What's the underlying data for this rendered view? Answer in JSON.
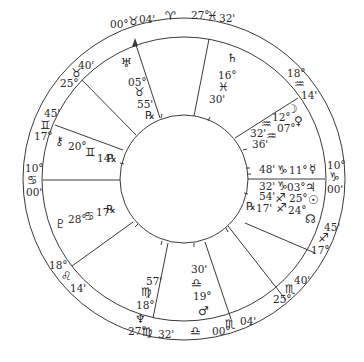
{
  "chart": {
    "type": "natal-wheel",
    "center": [
      184,
      179
    ],
    "radii": {
      "outer": 161,
      "middle": 142,
      "inner": 64
    },
    "line_color": "#3a3a3a"
  },
  "glyphs": {
    "aries": "♈",
    "taurus": "♉",
    "gemini": "♊",
    "cancer": "♋",
    "leo": "♌",
    "virgo": "♍",
    "libra": "♎",
    "scorpio": "♏",
    "sagittarius": "♐",
    "capricorn": "♑",
    "aquarius": "♒",
    "pisces": "♓",
    "sun": "☉",
    "moon": "☽",
    "mercury": "☿",
    "venus": "♀",
    "mars": "♂",
    "jupiter": "♃",
    "saturn": "♄",
    "uranus": "♅",
    "neptune": "♆",
    "pluto": "♇",
    "chiron": "⚷",
    "node": "☊",
    "retrograde": "℞"
  },
  "cusps": [
    {
      "id": "mc",
      "deg": "00°",
      "sign": "taurus",
      "min": "04'"
    },
    {
      "id": "c11",
      "deg": "27°",
      "sign": "pisces",
      "min": "32'"
    },
    {
      "id": "c12",
      "deg": "18°",
      "sign": "aquarius",
      "min": "14'"
    },
    {
      "id": "dsc",
      "deg": "10°",
      "sign": "capricorn",
      "min": "00'"
    },
    {
      "id": "c8",
      "deg": "17°",
      "sign": "sagittarius",
      "min": "45'"
    },
    {
      "id": "c7",
      "deg": "25°",
      "sign": "scorpio",
      "min": "40'"
    },
    {
      "id": "ic",
      "deg": "00°",
      "sign": "scorpio",
      "min": "04'"
    },
    {
      "id": "c5",
      "deg": "27°",
      "sign": "virgo",
      "min": "32'"
    },
    {
      "id": "c4",
      "deg": "18°",
      "sign": "leo",
      "min": "14'"
    },
    {
      "id": "asc",
      "deg": "10°",
      "sign": "cancer",
      "min": "00'"
    },
    {
      "id": "c2",
      "deg": "17°",
      "sign": "gemini",
      "min": "45'"
    },
    {
      "id": "c1",
      "deg": "25°",
      "sign": "taurus",
      "min": "40'"
    }
  ],
  "outer_ring_extra": {
    "aries_glyph": "♈",
    "libra_glyph": "♎"
  },
  "planets": [
    {
      "name": "Uranus",
      "glyph": "♅",
      "deg": "05°",
      "sign": "taurus",
      "min": "55'",
      "retro": true
    },
    {
      "name": "Saturn",
      "glyph": "♄",
      "deg": "16°",
      "sign": "pisces",
      "min": "30'",
      "retro": false
    },
    {
      "name": "Moon",
      "glyph": "☽",
      "deg": "12°",
      "sign": "aquarius",
      "min": "32'",
      "retro": false
    },
    {
      "name": "Venus",
      "glyph": "♀",
      "deg": "07°",
      "sign": "aquarius",
      "min": "36'",
      "retro": false
    },
    {
      "name": "Mercury",
      "glyph": "☿",
      "deg": "11°",
      "sign": "capricorn",
      "min": "48'",
      "retro": false
    },
    {
      "name": "Jupiter",
      "glyph": "♃",
      "deg": "03°",
      "sign": "capricorn",
      "min": "32'",
      "retro": false
    },
    {
      "name": "Sun",
      "glyph": "☉",
      "deg": "25°",
      "sign": "sagittarius",
      "min": "54'",
      "retro": false
    },
    {
      "name": "Node",
      "glyph": "☊",
      "deg": "24°",
      "sign": "sagittarius",
      "min": "17'",
      "retro": true
    },
    {
      "name": "Mars",
      "glyph": "♂",
      "deg": "19°",
      "sign": "libra",
      "min": "30'",
      "retro": false
    },
    {
      "name": "Neptune",
      "glyph": "♆",
      "deg": "18°",
      "sign": "virgo",
      "min": "57'",
      "retro": false
    },
    {
      "name": "Pluto",
      "glyph": "♇",
      "deg": "28°",
      "sign": "cancer",
      "min": "17'",
      "retro": true
    },
    {
      "name": "Chiron",
      "glyph": "⚷",
      "deg": "20°",
      "sign": "gemini",
      "min": "14'",
      "retro": true
    }
  ],
  "labels": {
    "mc_deg": "00°",
    "mc_sign": "♉",
    "mc_min": "04'",
    "aries": "♈",
    "c11_deg": "27°",
    "c11_sign": "♓",
    "c11_min": "32'",
    "c12_deg": "18°",
    "c12_sign": "♒",
    "c12_min": "14'",
    "dsc_deg": "10°",
    "dsc_sign": "♑",
    "dsc_min": "00'",
    "c8_min": "45'",
    "c8_sign": "♐",
    "c8_deg": "17°",
    "c7_min": "40'",
    "c7_sign": "♏",
    "c7_deg": "25°",
    "ic_min": "04'",
    "ic_sign": "♏",
    "ic_deg": "00°",
    "libra": "♎",
    "c5_deg": "27°",
    "c5_sign": "♍",
    "c5_min": "32'",
    "c4_deg": "18°",
    "c4_sign": "♌",
    "c4_min": "14'",
    "asc_deg": "10°",
    "asc_sign": "♋",
    "asc_min": "00'",
    "c2_min": "45'",
    "c2_sign": "♊",
    "c2_deg": "17°",
    "c1_deg": "25°",
    "c1_sign": "♉",
    "c1_min": "40'",
    "uranus_glyph": "♅",
    "uranus_deg": "05°",
    "uranus_sign": "♉",
    "uranus_min": "55'",
    "uranus_retro": "℞",
    "saturn_glyph": "♄",
    "saturn_deg": "16°",
    "saturn_sign": "♓",
    "saturn_min": "30'",
    "moon_glyph": "☽",
    "moon_deg": "12°",
    "moon_sign": "♒",
    "moon_min": "32'",
    "venus_glyph": "♀",
    "venus_deg": "07°",
    "venus_sign": "♒",
    "venus_min": "36'",
    "mercury_min": "48'",
    "mercury_sign": "♑",
    "mercury_deg": "11°",
    "mercury_glyph": "☿",
    "jupiter_min": "32'",
    "jupiter_sign": "♑",
    "jupiter_deg": "03°",
    "jupiter_glyph": "♃",
    "sun_min": "54'",
    "sun_sign": "♐",
    "sun_deg": "25°",
    "sun_glyph": "☉",
    "node_retro": "℞",
    "node_min": "17'",
    "node_sign": "♐",
    "node_deg": "24°",
    "node_glyph": "☊",
    "mars_min": "30'",
    "mars_sign": "♎",
    "mars_deg": "19°",
    "mars_glyph": "♂",
    "neptune_min": "57'",
    "neptune_sign": "♍",
    "neptune_deg": "18°",
    "neptune_glyph": "♆",
    "pluto_glyph": "♇",
    "pluto_deg": "28°",
    "pluto_sign": "♋",
    "pluto_min": "17'",
    "pluto_retro": "℞",
    "chiron_glyph": "⚷",
    "chiron_deg": "20°",
    "chiron_sign": "♊",
    "chiron_min": "14'",
    "chiron_retro": "℞"
  }
}
